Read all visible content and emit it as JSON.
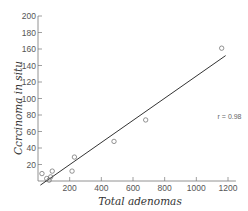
{
  "chart_data": {
    "type": "scatter",
    "title": "",
    "xlabel": "Total adenomas",
    "ylabel": "Carcinoma in situ",
    "xlim": [
      0,
      1250
    ],
    "ylim": [
      0,
      200
    ],
    "x_ticks": [
      200,
      400,
      600,
      800,
      1000,
      1200
    ],
    "y_ticks": [
      20,
      40,
      60,
      80,
      100,
      120,
      140,
      160,
      180,
      200
    ],
    "grid": false,
    "legend": null,
    "series": [
      {
        "name": "observations",
        "marker": "open-circle",
        "points": [
          {
            "x": 25,
            "y": 9
          },
          {
            "x": 55,
            "y": 3
          },
          {
            "x": 70,
            "y": 1
          },
          {
            "x": 80,
            "y": 5
          },
          {
            "x": 90,
            "y": 12
          },
          {
            "x": 215,
            "y": 12
          },
          {
            "x": 230,
            "y": 29
          },
          {
            "x": 480,
            "y": 48
          },
          {
            "x": 680,
            "y": 74
          },
          {
            "x": 1160,
            "y": 161
          }
        ]
      }
    ],
    "fit_line": {
      "x1": 15,
      "y1": -5,
      "x2": 1185,
      "y2": 152
    },
    "annotations": [
      {
        "text": "r = 0.98",
        "x": 1210,
        "y": 77
      }
    ]
  },
  "labels": {
    "xlabel": "Total adenomas",
    "ylabel": "Ccrcinoma in situ",
    "r_value": "r = 0.98"
  }
}
